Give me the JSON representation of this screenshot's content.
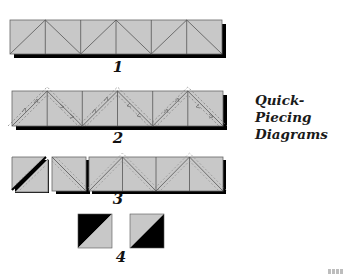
{
  "title": {
    "line1": "Quick-Piecing",
    "line2": "Diagrams"
  },
  "steps": [
    {
      "number": "1",
      "description": "Strip of six squares with alternating diagonal seams (zigzag)"
    },
    {
      "number": "2",
      "description": "Strip with dashed stitching lines on each side of diagonals and arrows showing sewing direction"
    },
    {
      "number": "3",
      "description": "Two squares cut off and opened showing diagonal cut between stitching lines; remaining strip of four squares"
    },
    {
      "number": "4",
      "description": "Two resulting half-square triangle units, black and gray"
    }
  ],
  "colors": {
    "fabric_light": "#c8c8c8",
    "fabric_dark": "#000000",
    "seam_line": "#555555",
    "shadow": "#000000"
  }
}
